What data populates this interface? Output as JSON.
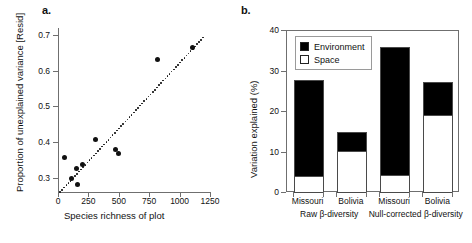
{
  "figure": {
    "panel_a_letter": "a.",
    "panel_b_letter": "b."
  },
  "chart_data": [
    {
      "type": "scatter",
      "panel": "a",
      "title": "",
      "xlabel": "Species richness of plot",
      "ylabel": "Proportion of unexplained variance [Resid]",
      "xlim": [
        0,
        1250
      ],
      "ylim": [
        0.26,
        0.72
      ],
      "xticks": [
        0,
        250,
        500,
        750,
        1000,
        1250
      ],
      "xtick_labels": [
        "0",
        "250",
        "500",
        "750",
        "1000",
        "1250"
      ],
      "yticks": [
        0.3,
        0.4,
        0.5,
        0.6,
        0.7
      ],
      "ytick_labels": [
        "0.3",
        "0.4",
        "0.5",
        "0.6",
        "0.7"
      ],
      "grid": false,
      "legend": "none",
      "marker": "filled-circle",
      "marker_color": "#111111",
      "points": [
        {
          "x": 55,
          "y": 0.357
        },
        {
          "x": 115,
          "y": 0.298
        },
        {
          "x": 150,
          "y": 0.325
        },
        {
          "x": 160,
          "y": 0.281
        },
        {
          "x": 205,
          "y": 0.337
        },
        {
          "x": 305,
          "y": 0.406
        },
        {
          "x": 470,
          "y": 0.379
        },
        {
          "x": 500,
          "y": 0.367
        },
        {
          "x": 815,
          "y": 0.633
        },
        {
          "x": 1105,
          "y": 0.666
        }
      ],
      "trendline": {
        "style": "dotted",
        "color": "#111111",
        "x0": 10,
        "y0": 0.262,
        "x1": 1200,
        "y1": 0.7
      }
    },
    {
      "type": "bar",
      "subtype": "stacked",
      "panel": "b",
      "title": "",
      "xlabel": "",
      "ylabel": "Variation explained (%)",
      "ylim": [
        0,
        40
      ],
      "yticks": [
        0,
        10,
        20,
        30,
        40
      ],
      "ytick_labels": [
        "0",
        "10",
        "20",
        "30",
        "40"
      ],
      "grid": false,
      "legend_position": "top-left",
      "categories": [
        "Missouri",
        "Bolivia",
        "Missouri",
        "Bolivia"
      ],
      "groups": [
        {
          "label": "Raw β-diversity",
          "categories": [
            "Missouri",
            "Bolivia"
          ]
        },
        {
          "label": "Null-corrected β-diversity",
          "categories": [
            "Missouri",
            "Bolivia"
          ]
        }
      ],
      "series": [
        {
          "name": "Space",
          "color": "#ffffff",
          "values": [
            4.0,
            10.2,
            4.2,
            19.0
          ]
        },
        {
          "name": "Environment",
          "color": "#000000",
          "values": [
            24.0,
            4.8,
            31.8,
            8.5
          ]
        }
      ],
      "bar_totals": [
        28.0,
        15.0,
        36.0,
        27.5
      ],
      "legend": [
        {
          "label": "Environment",
          "swatch": "filled",
          "color": "#000000"
        },
        {
          "label": "Space",
          "swatch": "hollow",
          "color": "#ffffff"
        }
      ]
    }
  ],
  "colors": {
    "environment": "#000000",
    "space": "#ffffff",
    "axis": "#6f6f6f",
    "text": "#111111"
  }
}
